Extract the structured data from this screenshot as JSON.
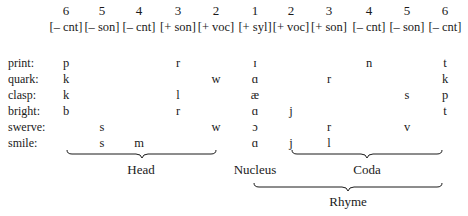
{
  "columns": [
    {
      "num": "6",
      "feature": "[– cnt]",
      "x": 66
    },
    {
      "num": "5",
      "feature": "[– son]",
      "x": 102
    },
    {
      "num": "4",
      "feature": "[– cnt]",
      "x": 139
    },
    {
      "num": "3",
      "feature": "[+ son]",
      "x": 178
    },
    {
      "num": "2",
      "feature": "[+ voc]",
      "x": 216
    },
    {
      "num": "1",
      "feature": "[+ syl]",
      "x": 255
    },
    {
      "num": "2",
      "feature": "[+ voc]",
      "x": 291
    },
    {
      "num": "3",
      "feature": "[+ son]",
      "x": 329
    },
    {
      "num": "4",
      "feature": "[– cnt]",
      "x": 369
    },
    {
      "num": "5",
      "feature": "[– son]",
      "x": 407
    },
    {
      "num": "6",
      "feature": "[– cnt]",
      "x": 445
    }
  ],
  "rows": [
    {
      "word": "print:",
      "segments": [
        "p",
        "",
        "",
        "r",
        "",
        "ɪ",
        "",
        "",
        "n",
        "",
        "t"
      ]
    },
    {
      "word": "quark:",
      "segments": [
        "k",
        "",
        "",
        "",
        "w",
        "ɑ",
        "",
        "r",
        "",
        "",
        "k"
      ]
    },
    {
      "word": "clasp:",
      "segments": [
        "k",
        "",
        "",
        "l",
        "",
        "æ",
        "",
        "",
        "",
        "s",
        "p"
      ]
    },
    {
      "word": "bright:",
      "segments": [
        "b",
        "",
        "",
        "r",
        "",
        "ɑ",
        "j",
        "",
        "",
        "",
        "t"
      ]
    },
    {
      "word": "swerve:",
      "segments": [
        "",
        "s",
        "",
        "",
        "w",
        "ɔ",
        "",
        "r",
        "",
        "v",
        ""
      ]
    },
    {
      "word": "smile:",
      "segments": [
        "",
        "s",
        "m",
        "",
        "",
        "ɑ",
        "j",
        "l",
        "",
        "",
        ""
      ]
    }
  ],
  "labels": {
    "head": "Head",
    "nucleus": "Nucleus",
    "coda": "Coda",
    "rhyme": "Rhyme"
  }
}
